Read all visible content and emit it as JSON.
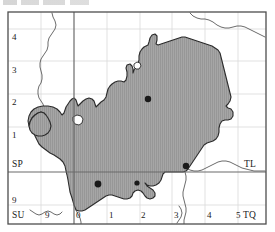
{
  "map": {
    "title": "Ordnance Survey grid distribution map",
    "frame": {
      "x": 8,
      "y": 12,
      "width": 258,
      "height": 212
    },
    "colors": {
      "fill": "#a6a6a6",
      "hatch": "#8f8f8f",
      "outline": "#2b2b2b",
      "frame": "#4d4d4d",
      "major_grid": "#6b6b6b",
      "minor_grid": "#d9d9d9",
      "coastline": "#3a3a3a",
      "dot": "#1a1a1a",
      "background": "#ffffff"
    },
    "grid_squares": [
      {
        "name": "SP",
        "label": "SP",
        "x": 12,
        "y": 160,
        "position": "left-middle"
      },
      {
        "name": "TL",
        "label": "TL",
        "x": 244,
        "y": 160,
        "position": "right-middle"
      },
      {
        "name": "SU",
        "label": "SU",
        "x": 12,
        "y": 211,
        "position": "bottom-left"
      },
      {
        "name": "TQ",
        "label": "TQ",
        "x": 243,
        "y": 211,
        "position": "bottom-right"
      }
    ],
    "y_ticks": [
      {
        "label": "4",
        "value": 4,
        "x": 12,
        "y": 33
      },
      {
        "label": "3",
        "value": 3,
        "x": 12,
        "y": 66
      },
      {
        "label": "2",
        "value": 2,
        "x": 12,
        "y": 98
      },
      {
        "label": "1",
        "value": 1,
        "x": 12,
        "y": 131
      },
      {
        "label": "9",
        "value": 9,
        "x": 12,
        "y": 196
      }
    ],
    "x_ticks": [
      {
        "label": "9",
        "value": 9,
        "x": 45,
        "y": 211
      },
      {
        "label": "0",
        "value": 0,
        "x": 76,
        "y": 211
      },
      {
        "label": "1",
        "value": 1,
        "x": 109,
        "y": 211
      },
      {
        "label": "2",
        "value": 2,
        "x": 141,
        "y": 211
      },
      {
        "label": "3",
        "value": 3,
        "x": 174,
        "y": 211
      },
      {
        "label": "4",
        "value": 4,
        "x": 207,
        "y": 211
      },
      {
        "label": "5",
        "value": 5,
        "x": 236,
        "y": 211
      }
    ],
    "major_grid_lines": {
      "vertical_x": 74,
      "horizontal_y": 172
    },
    "minor_grid_lines": {
      "vertical_x": [
        41,
        107,
        140,
        172,
        205,
        238
      ],
      "horizontal_y": [
        29,
        61,
        94,
        127,
        205
      ]
    },
    "records": [
      {
        "name": "record-dot-1",
        "x": 148,
        "y": 99,
        "r": 3.2
      },
      {
        "name": "record-dot-2",
        "x": 186,
        "y": 166,
        "r": 3.2
      },
      {
        "name": "record-dot-3",
        "x": 98,
        "y": 184,
        "r": 3.4
      },
      {
        "name": "record-dot-4",
        "x": 137,
        "y": 183,
        "r": 2.6
      }
    ],
    "region_outline": "M 76 210 L 74 205 L 72 198 L 70 192 L 69 186 L 68 180 L 67 175 L 66 171 L 65 166 L 63 162 L 60 159 L 57 157 L 54 155 L 50 153 L 46 150 L 42 147 L 39 144 L 37 140 L 35 136 L 34 132 L 34 128 L 35 124 L 37 121 L 40 119 L 43 118 L 45 116 L 44 113 L 41 112 L 38 113 L 35 115 L 32 118 L 30 122 L 29 126 L 28 121 L 29 116 L 31 112 L 34 109 L 38 107 L 43 106 L 48 106 L 53 107 L 57 109 L 60 112 L 62 115 L 64 113 L 65 110 L 66 107 L 68 104 L 70 101 L 72 99 L 74 98 L 76 100 L 77 103 L 78 106 L 80 104 L 83 101 L 86 99 L 89 98 L 92 99 L 94 101 L 95 104 L 96 107 L 98 105 L 101 102 L 104 100 L 106 97 L 107 93 L 108 89 L 110 86 L 112 84 L 115 82 L 118 81 L 121 81 L 124 82 L 126 80 L 127 76 L 127 72 L 126 68 L 127 65 L 130 64 L 132 66 L 133 69 L 133 73 L 134 70 L 136 67 L 138 64 L 139 60 L 139 56 L 140 52 L 142 49 L 144 47 L 146 46 L 148 45 L 149 42 L 150 38 L 152 35 L 155 34 L 157 36 L 157 40 L 156 44 L 158 45 L 161 44 L 164 43 L 167 42 L 170 41 L 173 40 L 176 39 L 179 38 L 182 37 L 185 37 L 188 38 L 191 39 L 194 40 L 197 41 L 200 42 L 203 43 L 206 44 L 209 45 L 212 46 L 215 48 L 218 50 L 220 53 L 221 57 L 222 61 L 223 65 L 224 69 L 225 73 L 226 77 L 227 81 L 228 85 L 229 89 L 230 93 L 231 97 L 230 101 L 228 104 L 226 106 L 228 108 L 231 109 L 233 112 L 233 116 L 231 119 L 228 120 L 225 120 L 222 121 L 220 124 L 219 128 L 219 132 L 218 136 L 216 139 L 213 141 L 210 142 L 207 143 L 204 145 L 202 148 L 200 151 L 198 154 L 196 157 L 194 160 L 192 163 L 190 166 L 188 169 L 186 171 L 183 172 L 180 172 L 177 172 L 174 172 L 171 172 L 168 172 L 165 172 L 163 174 L 162 177 L 161 180 L 159 183 L 156 185 L 153 186 L 150 186 L 147 185 L 145 183 L 147 186 L 150 188 L 153 190 L 155 193 L 155 196 L 153 198 L 150 199 L 147 198 L 145 196 L 143 193 L 141 191 L 138 190 L 135 191 L 133 193 L 132 196 L 130 198 L 127 199 L 124 199 L 121 198 L 118 197 L 115 196 L 112 195 L 109 195 L 106 196 L 103 198 L 100 200 L 97 202 L 94 204 L 91 206 L 88 208 L 85 210 L 82 211 L 79 211 Z",
    "region_west_lobe": "M 44 113 L 41 112 L 38 113 L 35 115 L 32 118 L 30 122 L 29 126 L 30 130 L 32 133 L 35 135 L 38 136 L 42 136 L 45 135 L 48 133 L 50 130 L 51 126 L 50 122 L 48 118 L 46 115 Z",
    "inner_holes": [
      "M 73 117 L 77 115 L 81 116 L 83 119 L 82 123 L 79 125 L 75 124 L 73 121 Z",
      "M 134 64 L 137 62 L 140 63 L 141 66 L 139 69 L 136 69 L 134 67 Z"
    ],
    "boundary_lines": [
      "M 52 13 L 53 17 L 55 21 L 56 25 L 55 29 L 53 32 L 51 35 L 49 38 L 48 42 L 48 46 L 47 50 L 45 53 L 43 56 L 41 59 L 40 63 L 40 67 L 41 71 L 42 75 L 42 79 L 41 83 L 39 86 L 38 90 L 38 94 L 39 98 L 41 101 L 43 104 L 44 108 L 44 112",
      "M 190 13 L 193 16 L 197 18 L 201 19 L 205 19 L 209 20 L 213 22 L 217 25 L 221 27 L 225 28 L 229 28 L 233 27 L 237 26 L 241 26 L 245 27 L 249 29 L 253 31 L 257 33 L 261 35 L 265 37",
      "M 182 166 L 186 168 L 190 170 L 194 171 L 198 171 L 202 170 L 206 168 L 210 166 L 214 164 L 218 162 L 222 161 L 226 161 L 230 162 L 234 164 L 238 166 L 242 168 L 246 169 L 250 170 L 254 171 L 258 171 L 262 171 L 265 171",
      "M 76 210 L 78 214 L 80 218 L 81 222 L 81 224",
      "M 185 172 L 186 176 L 186 180 L 185 184 L 184 188 L 183 192 L 183 196 L 184 200 L 185 204 L 186 208 L 186 212 L 185 216 L 184 220 L 184 224",
      "M 30 210 L 33 212 L 36 214 L 39 215 L 42 214 L 45 212 L 48 211 L 51 212 L 54 214 L 57 215 L 60 214 L 62 212",
      "M 179 206 L 181 209 L 182 213 L 181 217 L 179 220 L 177 223"
    ]
  }
}
